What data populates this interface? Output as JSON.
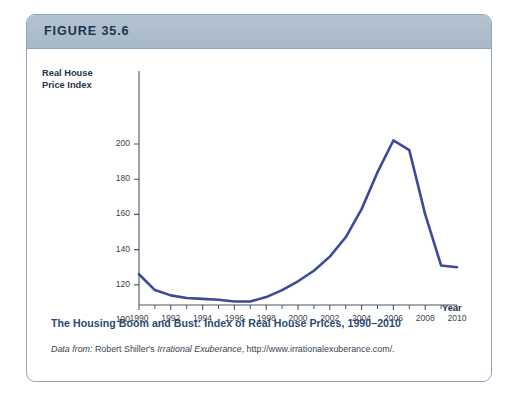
{
  "figure": {
    "number_label": "FIGURE 35.6",
    "caption_title": "The Housing Boom and Bust: Index of Real House Prices, 1990–2010",
    "source_prefix": "Data from:",
    "source_author": " Robert Shiller's ",
    "source_work": "Irrational Exuberance",
    "source_url": ", http://www.irrationalexuberance.com/.",
    "border_color": "#8fa6ba",
    "header_color": "#adbdcb",
    "title_color": "#2a4a73"
  },
  "chart_data": {
    "type": "line",
    "title": "The Housing Boom and Bust: Index of Real House Prices, 1990–2010",
    "xlabel": "Year",
    "ylabel": "Real House Price Index",
    "ylabel_line1": "Real House",
    "ylabel_line2": "Price Index",
    "xlim": [
      1990,
      2010
    ],
    "ylim": [
      95,
      208
    ],
    "grid": false,
    "legend": "none",
    "line_color": "#3b4a9c",
    "line_width": 2.6,
    "ytick_labels": [
      "200",
      "180",
      "160",
      "140",
      "120",
      "100"
    ],
    "yticks": [
      200,
      180,
      160,
      140,
      120,
      100
    ],
    "xtick_labels": [
      "1990",
      "1992",
      "1994",
      "1996",
      "1998",
      "2000",
      "2002",
      "2004",
      "2006",
      "2008",
      "2010"
    ],
    "xticks_major": [
      1990,
      1992,
      1994,
      1996,
      1998,
      2000,
      2002,
      2004,
      2006,
      2008,
      2010
    ],
    "xticks_minor": [
      1991,
      1993,
      1995,
      1997,
      1999,
      2001,
      2003,
      2005,
      2007,
      2009
    ],
    "series": [
      {
        "name": "Real House Price Index",
        "x": [
          1990,
          1991,
          1992,
          1993,
          1994,
          1995,
          1996,
          1997,
          1998,
          1999,
          2000,
          2001,
          2002,
          2003,
          2004,
          2005,
          2006,
          2007,
          2008,
          2009,
          2010
        ],
        "values": [
          126,
          117,
          114,
          112.5,
          112,
          111.5,
          110.5,
          110.5,
          113,
          117,
          122,
          128,
          136,
          147,
          163,
          184,
          202,
          196.5,
          160,
          131,
          130
        ]
      }
    ]
  }
}
